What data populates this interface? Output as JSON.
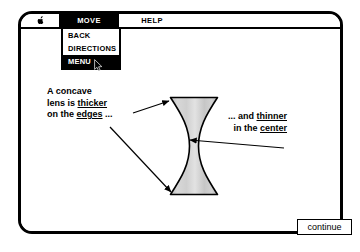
{
  "window": {
    "title": "",
    "background_color": "#ffffff",
    "border_color": "#000000"
  },
  "menu_bar": {
    "apple_icon": "apple-logo-icon",
    "items": [
      {
        "label": "MOVE",
        "selected": true
      },
      {
        "label": "HELP",
        "selected": false
      }
    ]
  },
  "dropdown": {
    "parent": "MOVE",
    "items": [
      {
        "label": "BACK",
        "selected": false
      },
      {
        "label": "DIRECTIONS",
        "selected": false
      },
      {
        "label": "MENU",
        "selected": true
      }
    ]
  },
  "cursor": {
    "icon": "mouse-pointer-icon",
    "over_item": "MENU"
  },
  "captions": {
    "left": {
      "line1": "A concave",
      "line2_pre": "lens is ",
      "line2_underlined": "thicker",
      "line3_pre": "on the ",
      "line3_underlined": "edges",
      "line3_post": " ..."
    },
    "right": {
      "line1_pre": "... and ",
      "line1_underlined": "thinner",
      "line2_pre": "in the ",
      "line2_underlined": "center"
    }
  },
  "diagram": {
    "shape_name": "concave-lens",
    "fill_color": "#c9c9c9",
    "outline_color": "#000000",
    "arrows": [
      {
        "name": "arrow-to-lens-top-edge",
        "direction": "right"
      },
      {
        "name": "arrow-to-lens-bottom-edge",
        "direction": "down-right"
      },
      {
        "name": "arrow-to-lens-center",
        "direction": "left"
      }
    ]
  },
  "footer": {
    "continue_label": "continue"
  }
}
